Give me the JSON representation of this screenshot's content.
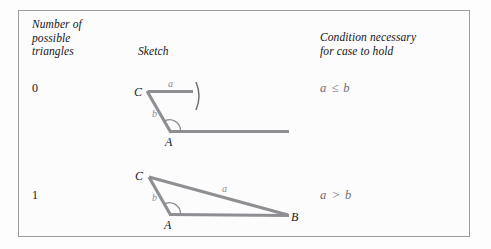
{
  "figure": {
    "title_headers": {
      "count_header": "Number of\npossible\ntriangles",
      "sketch_header": "Sketch",
      "condition_header": "Condition necessary\nfor case to hold"
    },
    "colors": {
      "border": "#9b9b9b",
      "background": "#fcfcfc",
      "segment": "#8e8e93",
      "label_dark": "#15151a",
      "label_gray": "#6d6d72"
    },
    "rows": [
      {
        "count": "0",
        "condition": "a ≤ b",
        "sketch": {
          "name": "no-triangle-sketch",
          "vertex_labels": {
            "C": "C",
            "A": "A"
          },
          "side_labels": {
            "a": "a",
            "b": "b"
          },
          "has_compass_arc": true,
          "has_angle_arc": true
        }
      },
      {
        "count": "1",
        "condition": "a > b",
        "sketch": {
          "name": "one-triangle-sketch",
          "vertex_labels": {
            "C": "C",
            "A": "A",
            "B": "B"
          },
          "side_labels": {
            "a": "a",
            "b": "b"
          },
          "has_compass_arc": false,
          "has_angle_arc": true
        }
      }
    ]
  }
}
